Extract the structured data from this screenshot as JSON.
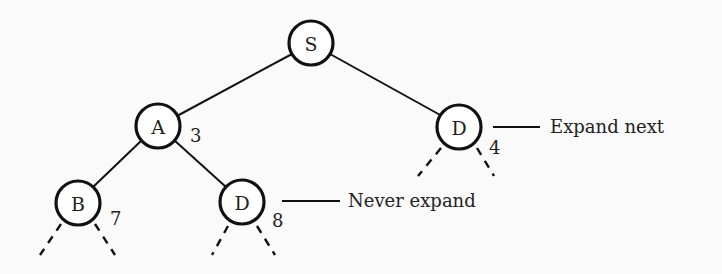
{
  "diagram": {
    "type": "search-tree",
    "nodes": [
      {
        "id": "S",
        "label": "S",
        "cost": null
      },
      {
        "id": "A",
        "label": "A",
        "cost": "3"
      },
      {
        "id": "D1",
        "label": "D",
        "cost": "4"
      },
      {
        "id": "B",
        "label": "B",
        "cost": "7"
      },
      {
        "id": "D2",
        "label": "D",
        "cost": "8"
      }
    ],
    "edges": [
      {
        "from": "S",
        "to": "A"
      },
      {
        "from": "S",
        "to": "D1"
      },
      {
        "from": "A",
        "to": "B"
      },
      {
        "from": "A",
        "to": "D2"
      }
    ],
    "annotations": {
      "expand_next": "Expand next",
      "never_expand": "Never expand"
    }
  }
}
